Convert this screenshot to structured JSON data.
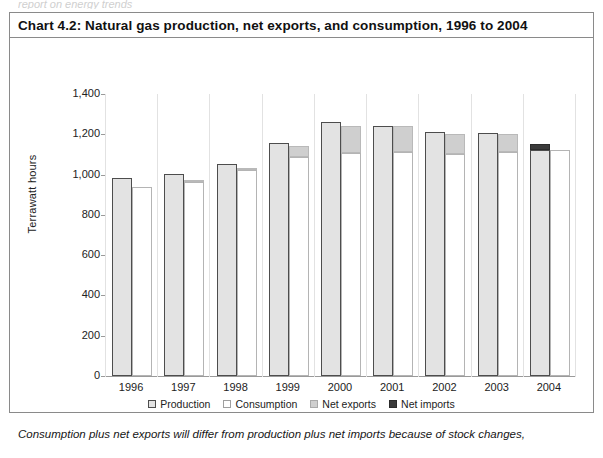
{
  "page": {
    "top_clipped_text": "report on energy trends",
    "footnote": "Consumption plus net exports will differ from production plus net imports because of stock changes,"
  },
  "chart_data": {
    "type": "bar",
    "subtype": "grouped-stacked",
    "title": "Chart 4.2:  Natural gas production, net exports, and consumption, 1996 to 2004",
    "xlabel": "",
    "ylabel": "Terrawatt hours",
    "ylim": [
      0,
      1400
    ],
    "ytick_step": 200,
    "yticks": [
      "0",
      "200",
      "400",
      "600",
      "800",
      "1,000",
      "1,200",
      "1,400"
    ],
    "grid": false,
    "legend_position": "bottom",
    "categories": [
      "1996",
      "1997",
      "1998",
      "1999",
      "2000",
      "2001",
      "2002",
      "2003",
      "2004"
    ],
    "series": [
      {
        "name": "Production",
        "key": "production",
        "color": "#e3e3e3",
        "border": "#4d4d4d",
        "values": [
          985,
          1003,
          1053,
          1158,
          1262,
          1242,
          1212,
          1205,
          1123
        ]
      },
      {
        "name": "Consumption",
        "key": "consumption",
        "color": "#ffffff",
        "border": "#b4b4b4",
        "values": [
          939,
          963,
          1022,
          1088,
          1108,
          1110,
          1103,
          1110,
          1123
        ]
      },
      {
        "name": "Net exports",
        "key": "net_exports",
        "color": "#cfcfcf",
        "border": "#b9b9b9",
        "values": [
          0,
          8,
          12,
          55,
          134,
          132,
          100,
          90,
          0
        ]
      },
      {
        "name": "Net imports",
        "key": "net_imports",
        "color": "#3a3a3a",
        "border": "#2b2b2b",
        "values": [
          0,
          0,
          0,
          0,
          0,
          0,
          0,
          0,
          30
        ]
      }
    ]
  }
}
